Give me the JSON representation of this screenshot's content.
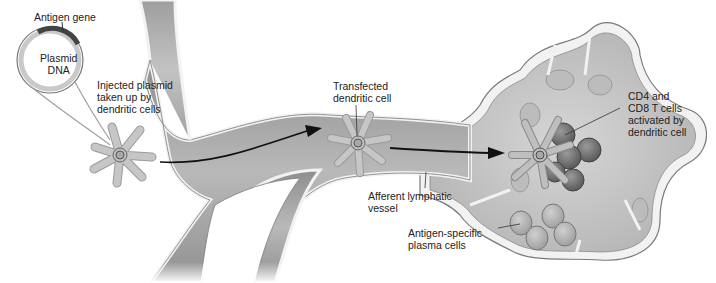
{
  "diagram": {
    "labels": {
      "antigen_gene": "Antigen gene",
      "plasmid_dna": "Plasmid\nDNA",
      "injected_plasmid": "Injected plasmid\ntaken up by\ndendritic cells",
      "transfected_cell": "Transfected\ndendritic cell",
      "afferent_vessel": "Afferent lymphatic\nvessel",
      "t_cells": "CD4 and\nCD8 T cells\nactivated by\ndendritic cell",
      "plasma_cells": "Antigen-specific\nplasma cells"
    },
    "colors": {
      "vessel_fill": "#a9a9a9",
      "vessel_wall": "#f2f2f2",
      "vessel_outline": "#6e6e6e",
      "node_fill": "#c9c9c9",
      "dendritic_cell": "#bdbdbd",
      "t_cell": "#6f6f6f",
      "plasma_cell": "#b5b5b5",
      "arrow": "#111111",
      "text": "#222222"
    }
  }
}
